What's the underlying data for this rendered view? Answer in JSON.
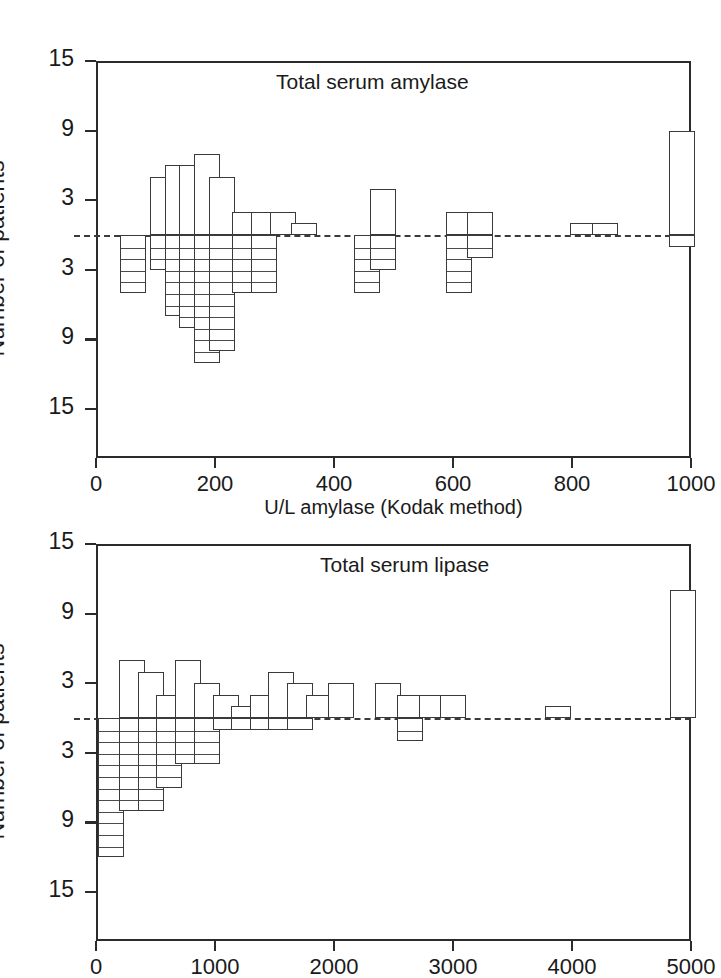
{
  "figure": {
    "axis_color": "#2b2b2b",
    "bar_color": "#ffffff",
    "bar_stroke": "#3a3a3a"
  },
  "panels": [
    {
      "id": "amylase",
      "title": "Total serum amylase",
      "ylabel": "Number of patients",
      "xlabel": "U/L amylase (Kodak method)",
      "ytick_labels": [
        "15",
        "9",
        "3",
        "3",
        "9",
        "15"
      ],
      "xtick_labels": [
        "0",
        "200",
        "400",
        "600",
        "800",
        "1000"
      ]
    },
    {
      "id": "lipase",
      "title": "Total serum lipase",
      "ylabel": "Number of patients",
      "xlabel": "",
      "ytick_labels": [
        "15",
        "9",
        "3",
        "3",
        "9",
        "15"
      ],
      "xtick_labels": [
        "0",
        "1000",
        "2000",
        "3000",
        "4000",
        "5000"
      ]
    }
  ],
  "chart_data": [
    {
      "type": "bar",
      "title": "Total serum amylase",
      "subtitle": "",
      "xlabel": "U/L amylase (Kodak method)",
      "ylabel": "Number of patients",
      "orientation": "back-to-back histogram",
      "note": "Upward bars = open rectangles; downward bars = stacked single-patient segments. Y axis is mirrored about zero (labels 15, 9, 3 | 3, 9, 15).",
      "xlim": [
        0,
        1000
      ],
      "ylim": [
        -15,
        15
      ],
      "ytick_values": [
        15,
        9,
        3,
        -3,
        -9,
        -15
      ],
      "ytick_labels": [
        "15",
        "9",
        "3",
        "3",
        "9",
        "15"
      ],
      "xtick_values": [
        0,
        200,
        400,
        600,
        800,
        1000
      ],
      "xtick_labels": [
        "0",
        "200",
        "400",
        "600",
        "800",
        "1000"
      ],
      "grid": false,
      "legend": "none",
      "bin_width": 25,
      "bars": [
        {
          "x": 62,
          "up": 0,
          "down": 5
        },
        {
          "x": 112,
          "up": 5,
          "down": 3
        },
        {
          "x": 137,
          "up": 6,
          "down": 7
        },
        {
          "x": 162,
          "up": 6,
          "down": 8
        },
        {
          "x": 187,
          "up": 7,
          "down": 11
        },
        {
          "x": 212,
          "up": 5,
          "down": 10
        },
        {
          "x": 250,
          "up": 2,
          "down": 5
        },
        {
          "x": 282,
          "up": 2,
          "down": 5
        },
        {
          "x": 315,
          "up": 2,
          "down": 0
        },
        {
          "x": 350,
          "up": 1,
          "down": 0
        },
        {
          "x": 455,
          "up": 0,
          "down": 5
        },
        {
          "x": 483,
          "up": 4,
          "down": 3
        },
        {
          "x": 610,
          "up": 2,
          "down": 5
        },
        {
          "x": 645,
          "up": 2,
          "down": 2
        },
        {
          "x": 818,
          "up": 1,
          "down": 0
        },
        {
          "x": 855,
          "up": 1,
          "down": 0
        },
        {
          "x": 985,
          "up": 9,
          "down": 1
        }
      ]
    },
    {
      "type": "bar",
      "title": "Total serum lipase",
      "subtitle": "",
      "xlabel": "",
      "ylabel": "Number of patients",
      "orientation": "back-to-back histogram",
      "note": "Upward bars = open rectangles; downward bars = stacked single-patient segments. Y axis is mirrored about zero (labels 15, 9, 3 | 3, 9, 15).",
      "xlim": [
        0,
        5000
      ],
      "ylim": [
        -15,
        15
      ],
      "ytick_values": [
        15,
        9,
        3,
        -3,
        -9,
        -15
      ],
      "ytick_labels": [
        "15",
        "9",
        "3",
        "3",
        "9",
        "15"
      ],
      "xtick_values": [
        0,
        1000,
        2000,
        3000,
        4000,
        5000
      ],
      "xtick_labels": [
        "0",
        "1000",
        "2000",
        "3000",
        "4000",
        "5000"
      ],
      "grid": false,
      "legend": "none",
      "bin_width": 125,
      "bars": [
        {
          "x": 130,
          "up": 0,
          "down": 12
        },
        {
          "x": 300,
          "up": 5,
          "down": 8
        },
        {
          "x": 460,
          "up": 4,
          "down": 8
        },
        {
          "x": 615,
          "up": 2,
          "down": 6
        },
        {
          "x": 775,
          "up": 5,
          "down": 4
        },
        {
          "x": 930,
          "up": 3,
          "down": 4
        },
        {
          "x": 1090,
          "up": 2,
          "down": 1
        },
        {
          "x": 1245,
          "up": 1,
          "down": 1
        },
        {
          "x": 1400,
          "up": 2,
          "down": 1
        },
        {
          "x": 1555,
          "up": 4,
          "down": 1
        },
        {
          "x": 1715,
          "up": 3,
          "down": 1
        },
        {
          "x": 1870,
          "up": 2,
          "down": 0
        },
        {
          "x": 2060,
          "up": 3,
          "down": 0
        },
        {
          "x": 2450,
          "up": 3,
          "down": 0
        },
        {
          "x": 2640,
          "up": 2,
          "down": 2
        },
        {
          "x": 2820,
          "up": 2,
          "down": 0
        },
        {
          "x": 3000,
          "up": 2,
          "down": 0
        },
        {
          "x": 3880,
          "up": 1,
          "down": 0
        },
        {
          "x": 4930,
          "up": 11,
          "down": 0
        }
      ]
    }
  ]
}
